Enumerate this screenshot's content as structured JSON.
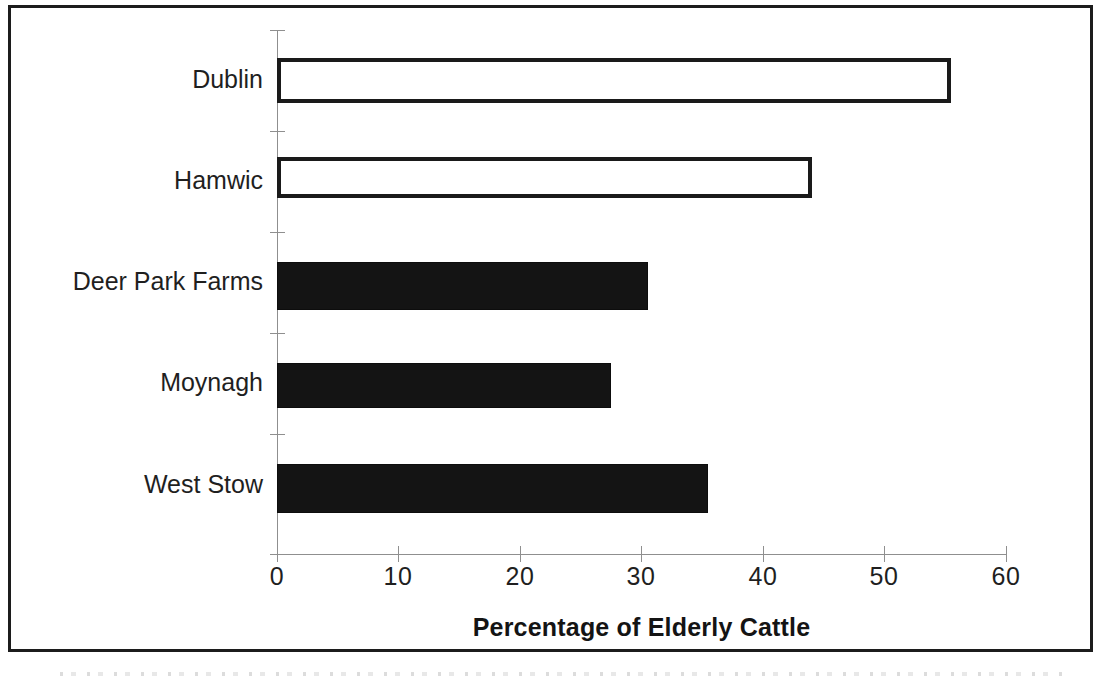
{
  "chart_data": {
    "type": "bar",
    "orientation": "horizontal",
    "title": "",
    "xlabel": "Percentage of Elderly Cattle",
    "ylabel": "",
    "categories": [
      "Dublin",
      "Hamwic",
      "Deer Park Farms",
      "Moynagh",
      "West Stow"
    ],
    "values": [
      55.5,
      44,
      30.5,
      27.5,
      35.5
    ],
    "bar_styles": [
      "hollow",
      "hollow",
      "filled",
      "filled",
      "filled"
    ],
    "xlim": [
      0,
      60
    ],
    "ylim": [],
    "xticks": [
      0,
      10,
      20,
      30,
      40,
      50,
      60
    ],
    "xtick_labels": [
      "0",
      "10",
      "20",
      "30",
      "40",
      "50",
      "60"
    ],
    "grid": false,
    "legend": null,
    "colors": {
      "filled_bar": "#141414",
      "hollow_bar_fill": "#ffffff",
      "hollow_bar_border": "#1a1a1a",
      "axis": "#8f8f8f",
      "text": "#1f1f1f",
      "page_border": "#1c1c1c",
      "background": "#ffffff"
    }
  },
  "axis": {
    "x_title": "Percentage of Elderly Cattle"
  }
}
